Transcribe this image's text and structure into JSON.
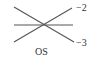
{
  "diagram": {
    "lines": [
      {
        "name": "descending-line",
        "x1": 14,
        "y1": 7,
        "x2": 74,
        "y2": 42,
        "label": "−3"
      },
      {
        "name": "ascending-line",
        "x1": 14,
        "y1": 42,
        "x2": 72,
        "y2": 8,
        "label": "−2"
      },
      {
        "name": "horizontal-line",
        "x1": 14,
        "y1": 25,
        "x2": 73,
        "y2": 25,
        "label": ""
      }
    ],
    "labels": {
      "upper_right": "−2",
      "lower_right": "−3",
      "caption": "OS"
    },
    "colors": {
      "line": "#555555",
      "text": "#333333"
    }
  }
}
